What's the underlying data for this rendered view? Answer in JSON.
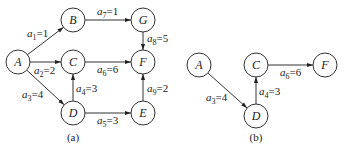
{
  "figure": {
    "panels": [
      {
        "id": "a",
        "caption": "(a)",
        "caption_pos": [
          73,
          141
        ],
        "nodes": [
          {
            "id": "A",
            "label": "A",
            "x": 18,
            "y": 62
          },
          {
            "id": "B",
            "label": "B",
            "x": 73,
            "y": 20
          },
          {
            "id": "C",
            "label": "C",
            "x": 73,
            "y": 62
          },
          {
            "id": "D",
            "label": "D",
            "x": 73,
            "y": 113
          },
          {
            "id": "G",
            "label": "G",
            "x": 143,
            "y": 20
          },
          {
            "id": "F",
            "label": "F",
            "x": 143,
            "y": 62
          },
          {
            "id": "E",
            "label": "E",
            "x": 143,
            "y": 113
          }
        ],
        "edges": [
          {
            "from": "A",
            "to": "B",
            "var": "a",
            "sub": "1",
            "value": "1",
            "lx": 27,
            "ly": 37
          },
          {
            "from": "A",
            "to": "C",
            "var": "a",
            "sub": "2",
            "value": "2",
            "lx": 34,
            "ly": 74
          },
          {
            "from": "A",
            "to": "D",
            "var": "a",
            "sub": "3",
            "value": "4",
            "lx": 22,
            "ly": 98
          },
          {
            "from": "D",
            "to": "C",
            "var": "a",
            "sub": "4",
            "value": "3",
            "lx": 76,
            "ly": 92
          },
          {
            "from": "D",
            "to": "E",
            "var": "a",
            "sub": "5",
            "value": "3",
            "lx": 97,
            "ly": 124
          },
          {
            "from": "C",
            "to": "F",
            "var": "a",
            "sub": "6",
            "value": "6",
            "lx": 97,
            "ly": 73
          },
          {
            "from": "B",
            "to": "G",
            "var": "a",
            "sub": "7",
            "value": "1",
            "lx": 97,
            "ly": 15
          },
          {
            "from": "G",
            "to": "F",
            "var": "a",
            "sub": "8",
            "value": "5",
            "lx": 147,
            "ly": 42
          },
          {
            "from": "E",
            "to": "F",
            "var": "a",
            "sub": "9",
            "value": "2",
            "lx": 147,
            "ly": 92
          }
        ]
      },
      {
        "id": "b",
        "caption": "(b)",
        "caption_pos": [
          256,
          141
        ],
        "nodes": [
          {
            "id": "A",
            "label": "A",
            "x": 199,
            "y": 65
          },
          {
            "id": "C",
            "label": "C",
            "x": 256,
            "y": 65
          },
          {
            "id": "F",
            "label": "F",
            "x": 325,
            "y": 65
          },
          {
            "id": "D",
            "label": "D",
            "x": 256,
            "y": 116
          }
        ],
        "edges": [
          {
            "from": "A",
            "to": "D",
            "var": "a",
            "sub": "3",
            "value": "4",
            "lx": 206,
            "ly": 101
          },
          {
            "from": "D",
            "to": "C",
            "var": "a",
            "sub": "4",
            "value": "3",
            "lx": 259,
            "ly": 95
          },
          {
            "from": "C",
            "to": "F",
            "var": "a",
            "sub": "6",
            "value": "6",
            "lx": 280,
            "ly": 76
          }
        ]
      }
    ],
    "node_radius": 12,
    "colors": {
      "stroke": "#333333",
      "text": "#222222",
      "background": "#ffffff"
    }
  }
}
